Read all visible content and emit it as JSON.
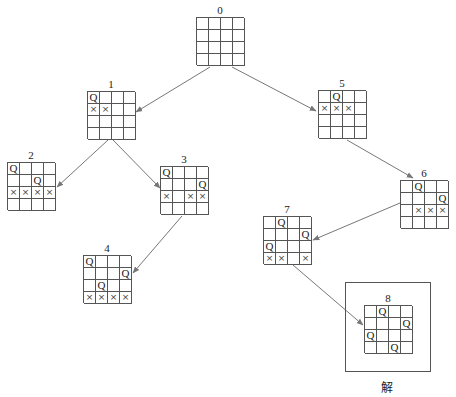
{
  "diagram": {
    "solution_caption": "解",
    "symbols": {
      "queen": "Q",
      "blocked": "×"
    },
    "nodes": [
      {
        "id": "0",
        "label": "0",
        "x": 196,
        "y": 17,
        "rows": [
          "....",
          "....",
          "....",
          "...."
        ]
      },
      {
        "id": "1",
        "label": "1",
        "x": 87,
        "y": 91,
        "rows": [
          "Q...",
          "XX..",
          "....",
          "...."
        ]
      },
      {
        "id": "2",
        "label": "2",
        "x": 7,
        "y": 162,
        "rows": [
          "Q...",
          "..Q.",
          "XXXX",
          "...."
        ]
      },
      {
        "id": "3",
        "label": "3",
        "x": 160,
        "y": 166,
        "rows": [
          "Q...",
          "...Q",
          "X.XX",
          "...."
        ]
      },
      {
        "id": "4",
        "label": "4",
        "x": 83,
        "y": 255,
        "rows": [
          "Q...",
          "...Q",
          ".Q..",
          "XXXX"
        ]
      },
      {
        "id": "5",
        "label": "5",
        "x": 318,
        "y": 90,
        "rows": [
          ".Q..",
          "XXX.",
          "....",
          "...."
        ]
      },
      {
        "id": "6",
        "label": "6",
        "x": 400,
        "y": 180,
        "rows": [
          ".Q..",
          "...Q",
          ".XXX",
          "...."
        ]
      },
      {
        "id": "7",
        "label": "7",
        "x": 263,
        "y": 216,
        "rows": [
          ".Q..",
          "...Q",
          "Q...",
          "XX.X"
        ]
      },
      {
        "id": "8",
        "label": "8",
        "x": 364,
        "y": 305,
        "rows": [
          ".Q..",
          "...Q",
          "Q...",
          "..Q."
        ]
      }
    ],
    "edges": [
      {
        "from": "0",
        "to": "1",
        "x1": 210,
        "y1": 67,
        "x2": 136,
        "y2": 112
      },
      {
        "from": "0",
        "to": "5",
        "x1": 232,
        "y1": 67,
        "x2": 316,
        "y2": 111
      },
      {
        "from": "1",
        "to": "2",
        "x1": 108,
        "y1": 140,
        "x2": 57,
        "y2": 187
      },
      {
        "from": "1",
        "to": "3",
        "x1": 113,
        "y1": 140,
        "x2": 160,
        "y2": 188
      },
      {
        "from": "3",
        "to": "4",
        "x1": 182,
        "y1": 216,
        "x2": 133,
        "y2": 273
      },
      {
        "from": "5",
        "to": "6",
        "x1": 347,
        "y1": 140,
        "x2": 413,
        "y2": 178
      },
      {
        "from": "6",
        "to": "7",
        "x1": 400,
        "y1": 203,
        "x2": 313,
        "y2": 240
      },
      {
        "from": "7",
        "to": "8",
        "x1": 293,
        "y1": 265,
        "x2": 363,
        "y2": 325
      }
    ],
    "colors": {
      "grid_line": "#555555",
      "arrow": "#777777",
      "text": "#222222"
    }
  }
}
